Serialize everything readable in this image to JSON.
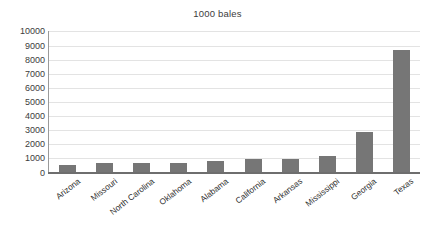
{
  "chart_data": {
    "type": "bar",
    "title": "1000 bales",
    "subtitle": "",
    "xlabel": "",
    "ylabel": "",
    "ylim": [
      0,
      10000
    ],
    "ytick_step": 1000,
    "yticks": [
      0,
      1000,
      2000,
      3000,
      4000,
      5000,
      6000,
      7000,
      8000,
      9000,
      10000
    ],
    "ytick_labels": [
      "0",
      "1000",
      "2000",
      "3000",
      "4000",
      "5000",
      "6000",
      "7000",
      "8000",
      "9000",
      "10000"
    ],
    "grid": true,
    "grid_axis": "y",
    "legend": false,
    "legend_position": "none",
    "bar_color": "#767676",
    "gridline_color": "#e3e3e3",
    "axis_color": "#6e6e6e",
    "text_color": "#3c3c3c",
    "background_color": "#ffffff",
    "categories": [
      "Arizona",
      "Missouri",
      "North Carolina",
      "Oklahoma",
      "Alabama",
      "California",
      "Arkansas",
      "Mississippi",
      "Georgia",
      "Texas"
    ],
    "values": [
      500,
      700,
      680,
      680,
      800,
      950,
      980,
      1150,
      2850,
      8650
    ],
    "xtick_rotation": -38
  }
}
